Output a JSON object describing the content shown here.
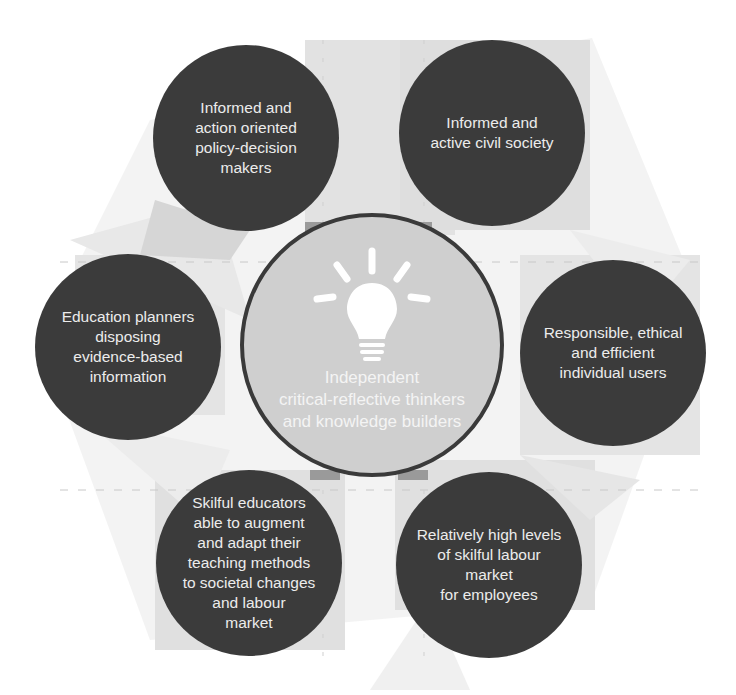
{
  "diagram": {
    "type": "hub-and-spoke",
    "colors": {
      "background": "#ffffff",
      "node_fill": "#3b3b3b",
      "node_text": "#ececec",
      "center_fill": "#cfcfcf",
      "center_border": "#3a3a3a",
      "center_text": "#f4f4f4",
      "backdrop_shape": "#e4e4e4",
      "backdrop_shape_dark": "#d2d2d2"
    },
    "center": {
      "icon": "lightbulb-icon",
      "title": "Independent\ncritical-reflective thinkers\nand knowledge builders"
    },
    "nodes": [
      {
        "position": "top-left",
        "label": "Informed and\naction oriented\npolicy-decision\nmakers"
      },
      {
        "position": "top-right",
        "label": "Informed and\nactive civil society"
      },
      {
        "position": "right",
        "label": "Responsible, ethical\nand efficient\nindividual users"
      },
      {
        "position": "bottom-right",
        "label": "Relatively high levels\nof skilful labour market\nfor employees"
      },
      {
        "position": "bottom-left",
        "label": "Skilful educators\nable to augment\nand adapt their\nteaching methods\nto societal changes\nand labour\nmarket"
      },
      {
        "position": "left",
        "label": "Education planners\ndisposing\nevidence-based\ninformation"
      }
    ]
  }
}
